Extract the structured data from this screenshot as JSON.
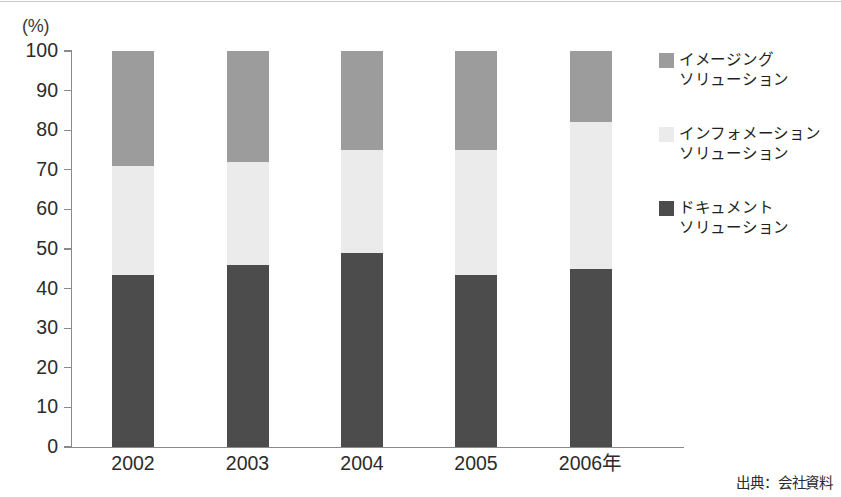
{
  "chart_data": {
    "type": "bar",
    "subtype": "100% stacked bar",
    "title": "",
    "xlabel": "",
    "ylabel": "(%)",
    "ylim": [
      0,
      100
    ],
    "yticks": [
      0,
      10,
      20,
      30,
      40,
      50,
      60,
      70,
      80,
      90,
      100
    ],
    "grid": false,
    "legend_position": "right",
    "categories": [
      "2002",
      "2003",
      "2004",
      "2005",
      "2006年"
    ],
    "series": [
      {
        "name": "ドキュメント\nソリューション",
        "color": "#4c4c4c",
        "values": [
          43.5,
          46.0,
          49.0,
          43.5,
          45.0
        ]
      },
      {
        "name": "インフォメーション\nソリューション",
        "color": "#ebebeb",
        "values": [
          27.5,
          26.0,
          26.0,
          31.5,
          37.0
        ]
      },
      {
        "name": "イメージング\nソリューション",
        "color": "#9c9c9c",
        "values": [
          29.0,
          28.0,
          25.0,
          25.0,
          18.0
        ]
      }
    ],
    "stack_tops": {
      "document": [
        43.5,
        46.0,
        49.0,
        43.5,
        45.0
      ],
      "document_plus_information": [
        71.0,
        72.0,
        75.0,
        75.0,
        82.0
      ],
      "total": [
        100,
        100,
        100,
        100,
        100
      ]
    },
    "annotations": [],
    "source_note": "出典：会社資料"
  },
  "axis": {
    "unit_label": "(%)",
    "tick_labels": [
      "100",
      "90",
      "80",
      "70",
      "60",
      "50",
      "40",
      "30",
      "20",
      "10",
      "0"
    ],
    "category_labels": [
      "2002",
      "2003",
      "2004",
      "2005",
      "2006年"
    ]
  },
  "legend": {
    "items": [
      {
        "label": "イメージング\nソリューション",
        "swatch": "imag",
        "color": "#9c9c9c"
      },
      {
        "label": "インフォメーション\nソリューション",
        "swatch": "info",
        "color": "#ebebeb"
      },
      {
        "label": "ドキュメント\nソリューション",
        "swatch": "doc",
        "color": "#4c4c4c"
      }
    ]
  },
  "footer": {
    "source": "出典：会社資料"
  }
}
